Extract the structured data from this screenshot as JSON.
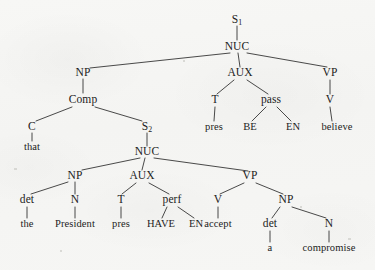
{
  "figure": {
    "type": "constituency-syntax-tree",
    "sentence": "that the President pres HAVE EN accept a compromise pres BE EN believe",
    "background_color": "#f6f6f4",
    "ink_color": "#1c1c1c"
  },
  "nodes": {
    "s1": {
      "label": "S",
      "sub": "1",
      "x": 237,
      "y": 20,
      "kind": "category"
    },
    "nuc1": {
      "label": "NUC",
      "sub": "",
      "x": 237,
      "y": 47,
      "kind": "category"
    },
    "np1": {
      "label": "NP",
      "sub": "",
      "x": 83,
      "y": 73,
      "kind": "category"
    },
    "aux1": {
      "label": "AUX",
      "sub": "",
      "x": 240,
      "y": 73,
      "kind": "category"
    },
    "vp1": {
      "label": "VP",
      "sub": "",
      "x": 330,
      "y": 73,
      "kind": "category"
    },
    "comp": {
      "label": "Comp",
      "sub": "",
      "x": 83,
      "y": 100,
      "kind": "category"
    },
    "t1": {
      "label": "T",
      "sub": "",
      "x": 215,
      "y": 100,
      "kind": "category"
    },
    "pass": {
      "label": "pass",
      "sub": "",
      "x": 271,
      "y": 100,
      "kind": "category"
    },
    "v1": {
      "label": "V",
      "sub": "",
      "x": 330,
      "y": 100,
      "kind": "category"
    },
    "c": {
      "label": "C",
      "sub": "",
      "x": 32,
      "y": 127,
      "kind": "category"
    },
    "s2": {
      "label": "S",
      "sub": "2",
      "x": 147,
      "y": 127,
      "kind": "category"
    },
    "pres1": {
      "label": "pres",
      "sub": "",
      "x": 214,
      "y": 127,
      "kind": "terminal"
    },
    "be": {
      "label": "BE",
      "sub": "",
      "x": 250,
      "y": 127,
      "kind": "terminal"
    },
    "en1": {
      "label": "EN",
      "sub": "",
      "x": 293,
      "y": 127,
      "kind": "terminal"
    },
    "believe": {
      "label": "believe",
      "sub": "",
      "x": 337,
      "y": 127,
      "kind": "terminal"
    },
    "that": {
      "label": "that",
      "sub": "",
      "x": 32,
      "y": 147,
      "kind": "terminal"
    },
    "nuc2": {
      "label": "NUC",
      "sub": "",
      "x": 147,
      "y": 152,
      "kind": "category"
    },
    "np2": {
      "label": "NP",
      "sub": "",
      "x": 75,
      "y": 176,
      "kind": "category"
    },
    "aux2": {
      "label": "AUX",
      "sub": "",
      "x": 142,
      "y": 176,
      "kind": "category"
    },
    "vp2": {
      "label": "VP",
      "sub": "",
      "x": 250,
      "y": 176,
      "kind": "category"
    },
    "det1": {
      "label": "det",
      "sub": "",
      "x": 27,
      "y": 200,
      "kind": "category"
    },
    "n1": {
      "label": "N",
      "sub": "",
      "x": 75,
      "y": 200,
      "kind": "category"
    },
    "t2": {
      "label": "T",
      "sub": "",
      "x": 121,
      "y": 200,
      "kind": "category"
    },
    "perf": {
      "label": "perf",
      "sub": "",
      "x": 172,
      "y": 200,
      "kind": "category"
    },
    "v2": {
      "label": "V",
      "sub": "",
      "x": 218,
      "y": 200,
      "kind": "category"
    },
    "np3": {
      "label": "NP",
      "sub": "",
      "x": 286,
      "y": 200,
      "kind": "category"
    },
    "the": {
      "label": "the",
      "sub": "",
      "x": 27,
      "y": 224,
      "kind": "terminal"
    },
    "president": {
      "label": "President",
      "sub": "",
      "x": 75,
      "y": 224,
      "kind": "terminal"
    },
    "pres2": {
      "label": "pres",
      "sub": "",
      "x": 121,
      "y": 224,
      "kind": "terminal"
    },
    "have": {
      "label": "HAVE",
      "sub": "",
      "x": 161,
      "y": 224,
      "kind": "terminal"
    },
    "en2": {
      "label": "EN",
      "sub": "",
      "x": 196,
      "y": 224,
      "kind": "terminal"
    },
    "accept": {
      "label": "accept",
      "sub": "",
      "x": 218,
      "y": 224,
      "kind": "terminal"
    },
    "det2": {
      "label": "det",
      "sub": "",
      "x": 270,
      "y": 224,
      "kind": "category"
    },
    "n2": {
      "label": "N",
      "sub": "",
      "x": 329,
      "y": 224,
      "kind": "category"
    },
    "a": {
      "label": "a",
      "sub": "",
      "x": 270,
      "y": 248,
      "kind": "terminal"
    },
    "compromise": {
      "label": "compromise",
      "sub": "",
      "x": 329,
      "y": 248,
      "kind": "terminal"
    }
  },
  "edges": [
    {
      "from": "s1",
      "to": "nuc1",
      "x1": 237,
      "y1": 26,
      "x2": 237,
      "y2": 40
    },
    {
      "from": "nuc1",
      "to": "np1",
      "x1": 230,
      "y1": 53,
      "x2": 90,
      "y2": 68
    },
    {
      "from": "nuc1",
      "to": "aux1",
      "x1": 238,
      "y1": 53,
      "x2": 240,
      "y2": 67
    },
    {
      "from": "nuc1",
      "to": "vp1",
      "x1": 247,
      "y1": 53,
      "x2": 327,
      "y2": 67
    },
    {
      "from": "np1",
      "to": "comp",
      "x1": 83,
      "y1": 79,
      "x2": 83,
      "y2": 93
    },
    {
      "from": "comp",
      "to": "c",
      "x1": 72,
      "y1": 107,
      "x2": 36,
      "y2": 121
    },
    {
      "from": "comp",
      "to": "s2",
      "x1": 95,
      "y1": 107,
      "x2": 142,
      "y2": 121
    },
    {
      "from": "c",
      "to": "that",
      "x1": 32,
      "y1": 133,
      "x2": 32,
      "y2": 141
    },
    {
      "from": "aux1",
      "to": "t1",
      "x1": 234,
      "y1": 80,
      "x2": 217,
      "y2": 94
    },
    {
      "from": "aux1",
      "to": "pass",
      "x1": 247,
      "y1": 80,
      "x2": 268,
      "y2": 94
    },
    {
      "from": "t1",
      "to": "pres1",
      "x1": 215,
      "y1": 107,
      "x2": 214,
      "y2": 121
    },
    {
      "from": "pass",
      "to": "be",
      "x1": 266,
      "y1": 107,
      "x2": 252,
      "y2": 121
    },
    {
      "from": "pass",
      "to": "en1",
      "x1": 277,
      "y1": 107,
      "x2": 291,
      "y2": 121
    },
    {
      "from": "vp1",
      "to": "v1",
      "x1": 330,
      "y1": 80,
      "x2": 330,
      "y2": 94
    },
    {
      "from": "v1",
      "to": "believe",
      "x1": 330,
      "y1": 107,
      "x2": 332,
      "y2": 121
    },
    {
      "from": "s2",
      "to": "nuc2",
      "x1": 147,
      "y1": 133,
      "x2": 147,
      "y2": 146
    },
    {
      "from": "nuc2",
      "to": "np2",
      "x1": 140,
      "y1": 158,
      "x2": 82,
      "y2": 170
    },
    {
      "from": "nuc2",
      "to": "aux2",
      "x1": 145,
      "y1": 158,
      "x2": 142,
      "y2": 170
    },
    {
      "from": "nuc2",
      "to": "vp2",
      "x1": 154,
      "y1": 158,
      "x2": 248,
      "y2": 171
    },
    {
      "from": "np2",
      "to": "det1",
      "x1": 68,
      "y1": 182,
      "x2": 31,
      "y2": 194
    },
    {
      "from": "np2",
      "to": "n1",
      "x1": 75,
      "y1": 182,
      "x2": 75,
      "y2": 194
    },
    {
      "from": "det1",
      "to": "the",
      "x1": 27,
      "y1": 207,
      "x2": 27,
      "y2": 218
    },
    {
      "from": "n1",
      "to": "president",
      "x1": 75,
      "y1": 207,
      "x2": 75,
      "y2": 218
    },
    {
      "from": "aux2",
      "to": "t2",
      "x1": 136,
      "y1": 183,
      "x2": 122,
      "y2": 194
    },
    {
      "from": "aux2",
      "to": "perf",
      "x1": 149,
      "y1": 183,
      "x2": 169,
      "y2": 194
    },
    {
      "from": "t2",
      "to": "pres2",
      "x1": 121,
      "y1": 207,
      "x2": 121,
      "y2": 218
    },
    {
      "from": "perf",
      "to": "have",
      "x1": 167,
      "y1": 207,
      "x2": 162,
      "y2": 218
    },
    {
      "from": "perf",
      "to": "en2",
      "x1": 178,
      "y1": 207,
      "x2": 194,
      "y2": 218
    },
    {
      "from": "vp2",
      "to": "v2",
      "x1": 244,
      "y1": 183,
      "x2": 220,
      "y2": 194
    },
    {
      "from": "vp2",
      "to": "np3",
      "x1": 256,
      "y1": 183,
      "x2": 283,
      "y2": 194
    },
    {
      "from": "v2",
      "to": "accept",
      "x1": 218,
      "y1": 207,
      "x2": 218,
      "y2": 218
    },
    {
      "from": "np3",
      "to": "det2",
      "x1": 280,
      "y1": 207,
      "x2": 272,
      "y2": 218
    },
    {
      "from": "np3",
      "to": "n2",
      "x1": 292,
      "y1": 207,
      "x2": 326,
      "y2": 218
    },
    {
      "from": "det2",
      "to": "a",
      "x1": 270,
      "y1": 231,
      "x2": 270,
      "y2": 242
    },
    {
      "from": "n2",
      "to": "compromise",
      "x1": 329,
      "y1": 231,
      "x2": 329,
      "y2": 242
    }
  ],
  "specks": [
    {
      "x": 14,
      "y": 168,
      "w": 3,
      "h": 2
    },
    {
      "x": 300,
      "y": 206,
      "w": 2,
      "h": 2
    },
    {
      "x": 348,
      "y": 238,
      "w": 3,
      "h": 2
    },
    {
      "x": 60,
      "y": 250,
      "w": 2,
      "h": 2
    },
    {
      "x": 183,
      "y": 60,
      "w": 2,
      "h": 2
    }
  ]
}
